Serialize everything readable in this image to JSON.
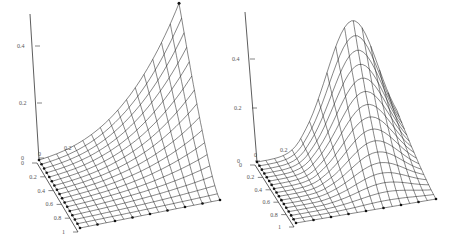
{
  "chart_data": [
    {
      "type": "surface",
      "title": "",
      "z_ticks": [
        "0",
        "0.2",
        "0.4"
      ],
      "x_ticks": [
        "0",
        "0.2",
        "0.4",
        "0.6",
        "0.8",
        "1"
      ],
      "back_ticks": [
        "0",
        "0.2"
      ],
      "grid": 16,
      "zlim": [
        0,
        0.5
      ],
      "peak": {
        "x": 1,
        "y": 0,
        "z": 0.48
      },
      "description": "Surface peaking sharply at far corner (x=1, y=0), near zero along y=0 edge at origin"
    },
    {
      "type": "surface",
      "title": "",
      "z_ticks": [
        "0",
        "0.2",
        "0.4"
      ],
      "x_ticks": [
        "0",
        "0.2",
        "0.4",
        "0.6",
        "0.8",
        "1"
      ],
      "back_ticks": [
        "0",
        "0.2"
      ],
      "grid": 16,
      "zlim": [
        0,
        0.55
      ],
      "peak": {
        "x": 0.7,
        "y": 0,
        "z": 0.5
      },
      "description": "Smooth bell-shaped surface peaking near x≈0.7 on the back edge"
    }
  ],
  "plots": [
    {
      "id": "left",
      "origin": [
        39,
        160
      ],
      "axis_top": [
        30,
        14
      ],
      "front_corner": [
        80,
        228
      ],
      "right_corner": [
        220,
        200
      ],
      "zscale": 268,
      "ticks_z": [
        {
          "label": "0.4",
          "y": 46,
          "x": 31
        },
        {
          "label": "0.2",
          "y": 103,
          "x": 33
        },
        {
          "label": "0",
          "y": 158,
          "x": 35
        }
      ],
      "ticks_x": [
        {
          "label": "0",
          "t": 0
        },
        {
          "label": "0.2",
          "t": 0.2
        },
        {
          "label": "0.4",
          "t": 0.4
        },
        {
          "label": "0.6",
          "t": 0.6
        },
        {
          "label": "0.8",
          "t": 0.8
        },
        {
          "label": "1",
          "t": 1
        }
      ],
      "back_labels": [
        {
          "label": "0",
          "x": 38,
          "y": 156
        },
        {
          "label": "0.2",
          "x": 64,
          "y": 150
        }
      ]
    },
    {
      "id": "right",
      "origin": [
        257,
        162
      ],
      "axis_top": [
        245,
        12
      ],
      "front_corner": [
        296,
        223
      ],
      "right_corner": [
        436,
        199
      ],
      "zscale": 250,
      "ticks_z": [
        {
          "label": "0.4",
          "y": 59,
          "x": 246
        },
        {
          "label": "0.2",
          "y": 108,
          "x": 248
        },
        {
          "label": "0",
          "y": 161,
          "x": 251
        }
      ],
      "ticks_x": [
        {
          "label": "0",
          "t": 0
        },
        {
          "label": "0.2",
          "t": 0.2
        },
        {
          "label": "0.4",
          "t": 0.4
        },
        {
          "label": "0.6",
          "t": 0.6
        },
        {
          "label": "0.8",
          "t": 0.8
        },
        {
          "label": "1",
          "t": 1
        }
      ],
      "back_labels": [
        {
          "label": "0",
          "x": 254,
          "y": 157
        },
        {
          "label": "0.2",
          "x": 280,
          "y": 152
        }
      ]
    }
  ]
}
